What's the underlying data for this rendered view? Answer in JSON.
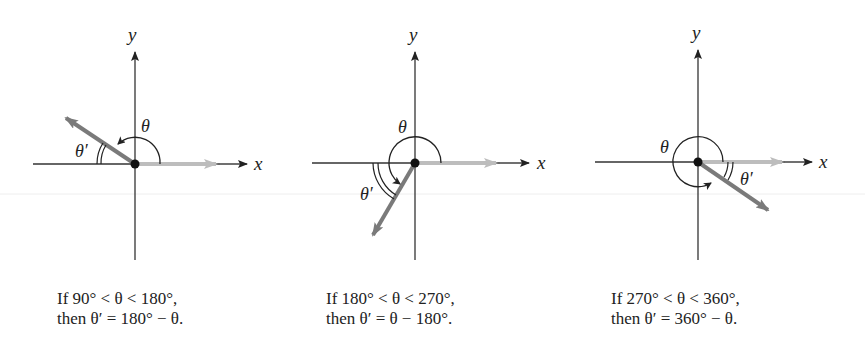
{
  "figure": {
    "colors": {
      "axis": "#333333",
      "terminal_side": "#7a7a7a",
      "initial_side": "#bdbdbd",
      "arc": "#222222",
      "faint_line": "#eeeeee"
    },
    "panels": [
      {
        "id": "quadrant-ii",
        "axis_x_label": "x",
        "axis_y_label": "y",
        "theta_label": "θ",
        "theta_prime_label": "θ′",
        "caption_line1": "If 90° < θ < 180°,",
        "caption_line2": "then θ′ = 180° − θ."
      },
      {
        "id": "quadrant-iii",
        "axis_x_label": "x",
        "axis_y_label": "y",
        "theta_label": "θ",
        "theta_prime_label": "θ′",
        "caption_line1": "If 180° < θ < 270°,",
        "caption_line2": "then θ′ = θ − 180°."
      },
      {
        "id": "quadrant-iv",
        "axis_x_label": "x",
        "axis_y_label": "y",
        "theta_label": "θ",
        "theta_prime_label": "θ′",
        "caption_line1": "If 270° < θ < 360°,",
        "caption_line2": "then θ′ = 360° − θ."
      }
    ]
  }
}
